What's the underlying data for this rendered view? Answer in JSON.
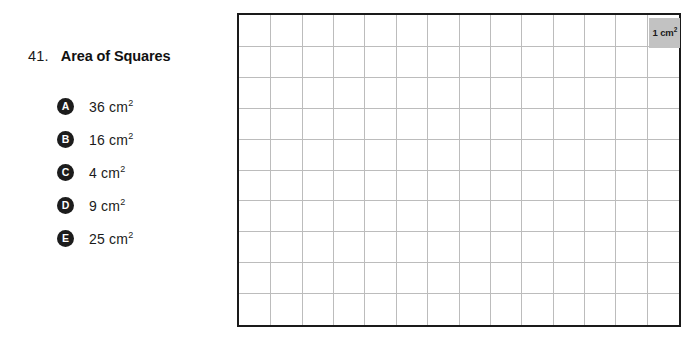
{
  "question": {
    "number": "41.",
    "title": "Area of Squares",
    "options": [
      {
        "letter": "A",
        "value": "36 cm",
        "exponent": "2"
      },
      {
        "letter": "B",
        "value": "16 cm",
        "exponent": "2"
      },
      {
        "letter": "C",
        "value": "4 cm",
        "exponent": "2"
      },
      {
        "letter": "D",
        "value": "9 cm",
        "exponent": "2"
      },
      {
        "letter": "E",
        "value": "25 cm",
        "exponent": "2"
      }
    ]
  },
  "figure": {
    "columns": 14,
    "rows": 10,
    "unit_cell": {
      "label": "1 cm",
      "exponent": "2",
      "column_index": 13,
      "row_index": 0,
      "fill_color": "#c2c2c2"
    },
    "border_color": "#1a1a1a",
    "gridline_color": "#bcbcbc",
    "background_color": "#ffffff"
  }
}
